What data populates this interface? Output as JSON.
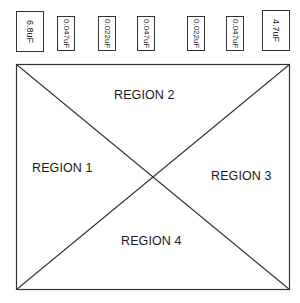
{
  "capacitors": [
    {
      "label": "6.8uF"
    },
    {
      "label": "0.047uF"
    },
    {
      "label": "0.022uF"
    },
    {
      "label": "0.047uF"
    },
    {
      "label": "0.022uF"
    },
    {
      "label": "0.047uF"
    },
    {
      "label": "4.7uF"
    }
  ],
  "regions": {
    "r1": "REGION 1",
    "r2": "REGION 2",
    "r3": "REGION 3",
    "r4": "REGION 4"
  },
  "colors": {
    "stroke": "#333333",
    "background": "#ffffff"
  }
}
